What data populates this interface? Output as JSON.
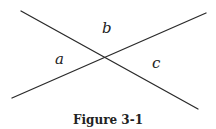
{
  "diagram": {
    "lines": [
      {
        "id": "line-1",
        "x1": 21,
        "y1": 11,
        "x2": 198,
        "y2": 109,
        "color": "#2a2a2a",
        "width": 1.3
      },
      {
        "id": "line-2",
        "x1": 12,
        "y1": 98,
        "x2": 206,
        "y2": 13,
        "color": "#2a2a2a",
        "width": 1.3
      }
    ],
    "intersection": {
      "x": 105,
      "y": 58
    },
    "labels": {
      "a": {
        "text": "a",
        "x": 55,
        "y": 64
      },
      "b": {
        "text": "b",
        "x": 102,
        "y": 33
      },
      "c": {
        "text": "c",
        "x": 152,
        "y": 68
      }
    },
    "caption": {
      "text": "Figure 3-1",
      "x": 108,
      "y": 124
    }
  }
}
